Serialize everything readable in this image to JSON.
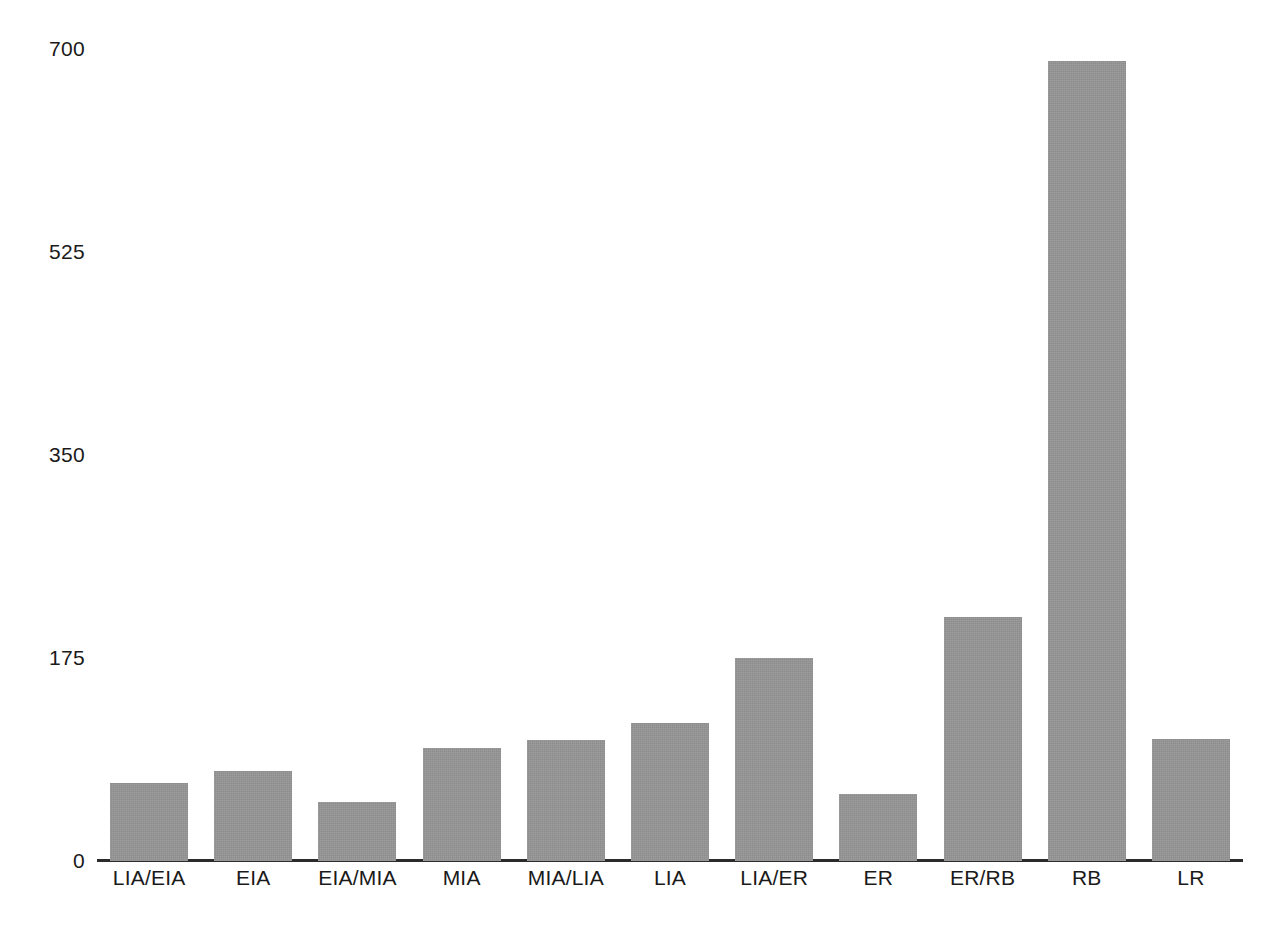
{
  "chart_data": {
    "type": "bar",
    "title": "",
    "subtitle": "",
    "xlabel": "",
    "ylabel": "",
    "grid": false,
    "legend": "none",
    "categories": [
      "LIA/EIA",
      "EIA",
      "EIA/MIA",
      "MIA",
      "MIA/LIA",
      "LIA",
      "LIA/ER",
      "ER",
      "ER/RB",
      "RB",
      "LR"
    ],
    "values": [
      67,
      78,
      51,
      97,
      104,
      119,
      175,
      58,
      210,
      690,
      105
    ],
    "ylim": [
      0,
      700
    ],
    "yticks": [
      0,
      175,
      350,
      525,
      700
    ],
    "ytick_labels": [
      "0",
      "175",
      "350",
      "525",
      "700"
    ],
    "bar_color": "#969696",
    "axis_color": "#2b2b2b",
    "text_color": "#1a1a1a"
  }
}
